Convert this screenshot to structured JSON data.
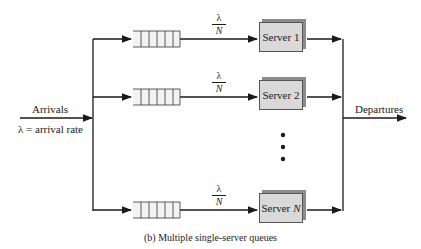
{
  "diagram": {
    "arrivals_label": "Arrivals",
    "arrival_rate_label": "λ = arrival rate",
    "departures_label": "Departures",
    "rate_fraction": {
      "numerator": "λ",
      "denominator": "N"
    },
    "servers": [
      {
        "label": "Server",
        "index": "1"
      },
      {
        "label": "Server",
        "index": "2"
      },
      {
        "label": "Server",
        "index": "N"
      }
    ],
    "ellipsis": "•••",
    "caption": "(b) Multiple single-server queues",
    "colors": {
      "line": "#1a1a1a",
      "server_fill": "#d9d9d9",
      "server_shadow": "#8c8c8c",
      "queue_fill": "#f2f2f2"
    }
  }
}
